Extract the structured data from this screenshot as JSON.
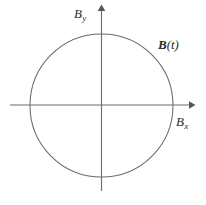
{
  "figure": {
    "type": "phase-plane-diagram",
    "background_color": "#ffffff",
    "line_color": "#6a6a6a",
    "text_color": "#2b2b2b",
    "labels": {
      "y_axis": {
        "base": "B",
        "subscript": "y"
      },
      "x_axis": {
        "base": "B",
        "subscript": "x"
      },
      "curve": {
        "base": "B",
        "argument": "(t)"
      }
    }
  },
  "chart_data": {
    "type": "line",
    "title": "",
    "subtitle": "",
    "xlabel": "B_x",
    "ylabel": "B_y",
    "legend": [
      "B(t)"
    ],
    "legend_position": "inline-upper-right",
    "grid": false,
    "axes": {
      "x": {
        "label": "B_x",
        "min": -1.28,
        "max": 1.28,
        "arrow": true,
        "ticks": []
      },
      "y": {
        "label": "B_y",
        "min": -1.2,
        "max": 1.38,
        "arrow": true,
        "ticks": []
      }
    },
    "annotations": [
      {
        "text": "B(t)",
        "x": 0.82,
        "y": 0.82,
        "style": "bold-italic"
      }
    ],
    "series": [
      {
        "name": "B(t)",
        "shape": "circle",
        "center": [
          0,
          0
        ],
        "radius": 1,
        "closed": true,
        "description": "Closed circular trajectory of the magnetic field vector B(t) in the Bx-By plane",
        "points": [
          [
            1.0,
            0.0
          ],
          [
            0.966,
            0.259
          ],
          [
            0.866,
            0.5
          ],
          [
            0.707,
            0.707
          ],
          [
            0.5,
            0.866
          ],
          [
            0.259,
            0.966
          ],
          [
            0.0,
            1.0
          ],
          [
            -0.259,
            0.966
          ],
          [
            -0.5,
            0.866
          ],
          [
            -0.707,
            0.707
          ],
          [
            -0.866,
            0.5
          ],
          [
            -0.966,
            0.259
          ],
          [
            -1.0,
            0.0
          ],
          [
            -0.966,
            -0.259
          ],
          [
            -0.866,
            -0.5
          ],
          [
            -0.707,
            -0.707
          ],
          [
            -0.5,
            -0.866
          ],
          [
            -0.259,
            -0.966
          ],
          [
            0.0,
            -1.0
          ],
          [
            0.259,
            -0.966
          ],
          [
            0.5,
            -0.866
          ],
          [
            0.707,
            -0.707
          ],
          [
            0.866,
            -0.5
          ],
          [
            0.966,
            -0.259
          ],
          [
            1.0,
            0.0
          ]
        ]
      }
    ]
  }
}
